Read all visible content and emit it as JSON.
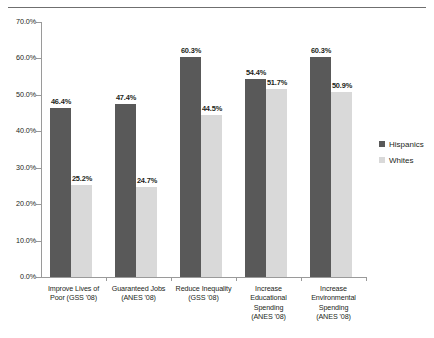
{
  "chart_data": {
    "type": "bar",
    "title": "",
    "subtitle": "",
    "xlabel": "",
    "ylabel": "",
    "ylim": [
      0,
      70
    ],
    "ytick_labels": [
      "70.0%",
      "60.0%",
      "50.0%",
      "40.0%",
      "30.0%",
      "20.0%",
      "10.0%",
      "0.0%"
    ],
    "ytick_values": [
      70,
      60,
      50,
      40,
      30,
      20,
      10,
      0
    ],
    "grid": false,
    "legend_position": "right",
    "categories": [
      "Improve Lives of Poor  (GSS '08)",
      "Guaranteed Jobs (ANES '08)",
      "Reduce Inequality (GSS '08)",
      "Increase Educational Spending (ANES '08)",
      "Increase Environmental Spending (ANES '08)"
    ],
    "category_lines": [
      [
        "Improve Lives of",
        "Poor   (GSS '08)"
      ],
      [
        "Guaranteed Jobs",
        "(ANES '08)"
      ],
      [
        "Reduce Inequality",
        "(GSS '08)"
      ],
      [
        "Increase",
        "Educational",
        "Spending",
        "(ANES '08)"
      ],
      [
        "Increase",
        "Environmental",
        "Spending",
        "(ANES '08)"
      ]
    ],
    "series": [
      {
        "name": "Hispanics",
        "color": "#595959",
        "values": [
          46.4,
          47.4,
          60.3,
          54.4,
          60.3
        ],
        "labels": [
          "46.4%",
          "47.4%",
          "60.3%",
          "54.4%",
          "60.3%"
        ]
      },
      {
        "name": "Whites",
        "color": "#d9d9d9",
        "values": [
          25.2,
          24.7,
          44.5,
          51.7,
          50.9
        ],
        "labels": [
          "25.2%",
          "24.7%",
          "44.5%",
          "51.7%",
          "50.9%"
        ]
      }
    ]
  },
  "legend": {
    "items": [
      {
        "label": "Hispanics",
        "color": "#595959"
      },
      {
        "label": "Whites",
        "color": "#d9d9d9"
      }
    ]
  }
}
